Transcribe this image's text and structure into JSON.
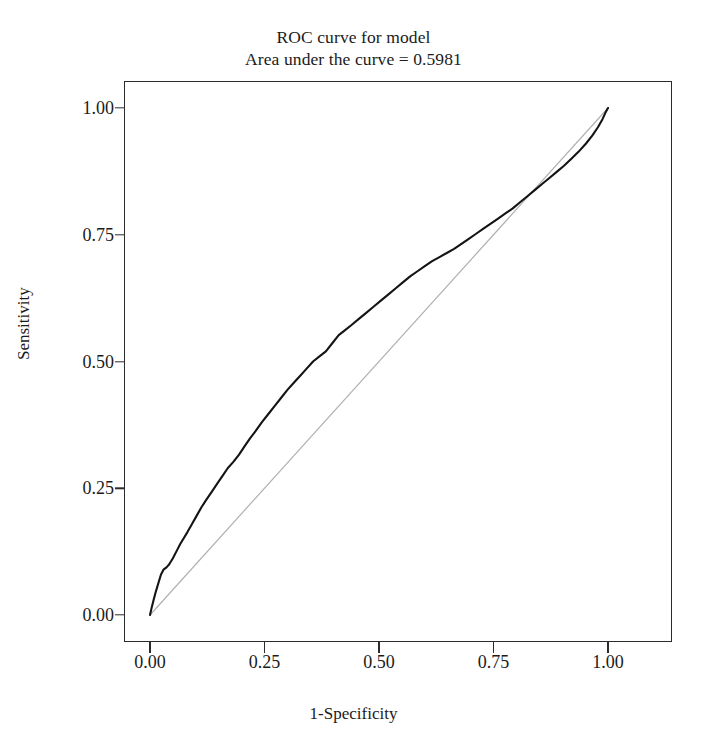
{
  "chart_data": {
    "type": "line",
    "title": "ROC curve for model",
    "subtitle": "Area under the curve = 0.5981",
    "xlabel": "1-Specificity",
    "ylabel": "Sensitivity",
    "xlim": [
      0.0,
      1.0
    ],
    "ylim": [
      0.0,
      1.0
    ],
    "xticks": [
      "0.00",
      "0.25",
      "0.50",
      "0.75",
      "1.00"
    ],
    "yticks": [
      "0.00",
      "0.25",
      "0.50",
      "0.75",
      "1.00"
    ],
    "xtick_values": [
      0.0,
      0.25,
      0.5,
      0.75,
      1.0
    ],
    "ytick_values": [
      0.0,
      0.25,
      0.5,
      0.75,
      1.0
    ],
    "grid": false,
    "legend": "none",
    "auc": 0.5981,
    "series": [
      {
        "name": "ROC curve",
        "color": "#141414",
        "style": "solid",
        "x": [
          0.0,
          0.004,
          0.008,
          0.012,
          0.016,
          0.02,
          0.024,
          0.03,
          0.036,
          0.042,
          0.05,
          0.058,
          0.066,
          0.074,
          0.082,
          0.092,
          0.102,
          0.112,
          0.122,
          0.134,
          0.146,
          0.158,
          0.17,
          0.182,
          0.194,
          0.206,
          0.218,
          0.23,
          0.244,
          0.258,
          0.272,
          0.286,
          0.3,
          0.314,
          0.328,
          0.342,
          0.356,
          0.37,
          0.384,
          0.398,
          0.412,
          0.426,
          0.44,
          0.456,
          0.472,
          0.488,
          0.504,
          0.52,
          0.536,
          0.552,
          0.568,
          0.584,
          0.6,
          0.616,
          0.632,
          0.648,
          0.664,
          0.68,
          0.696,
          0.712,
          0.728,
          0.744,
          0.76,
          0.776,
          0.792,
          0.808,
          0.824,
          0.84,
          0.856,
          0.872,
          0.888,
          0.904,
          0.92,
          0.936,
          0.952,
          0.966,
          0.978,
          0.988,
          0.994,
          1.0
        ],
        "y": [
          0.0,
          0.016,
          0.03,
          0.044,
          0.056,
          0.068,
          0.08,
          0.09,
          0.094,
          0.1,
          0.112,
          0.126,
          0.14,
          0.152,
          0.164,
          0.18,
          0.196,
          0.212,
          0.226,
          0.242,
          0.258,
          0.274,
          0.29,
          0.302,
          0.316,
          0.332,
          0.348,
          0.362,
          0.38,
          0.396,
          0.412,
          0.428,
          0.444,
          0.458,
          0.472,
          0.486,
          0.5,
          0.51,
          0.52,
          0.536,
          0.552,
          0.562,
          0.572,
          0.584,
          0.596,
          0.608,
          0.62,
          0.632,
          0.644,
          0.656,
          0.668,
          0.678,
          0.688,
          0.698,
          0.706,
          0.714,
          0.722,
          0.732,
          0.742,
          0.752,
          0.762,
          0.772,
          0.782,
          0.792,
          0.802,
          0.814,
          0.826,
          0.838,
          0.85,
          0.862,
          0.874,
          0.886,
          0.9,
          0.914,
          0.93,
          0.946,
          0.962,
          0.978,
          0.99,
          1.0
        ]
      },
      {
        "name": "Reference diagonal",
        "color": "#b0b0b0",
        "style": "solid",
        "x": [
          0.0,
          1.0
        ],
        "y": [
          0.0,
          1.0
        ]
      }
    ]
  }
}
